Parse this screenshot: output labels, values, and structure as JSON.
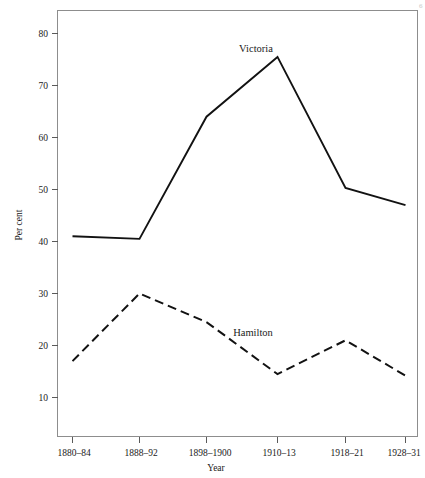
{
  "chart_data": {
    "type": "line",
    "title": "",
    "xlabel": "Year",
    "ylabel": "Per cent",
    "categories": [
      "1880–84",
      "1888–92",
      "1898–1900",
      "1910–13",
      "1918–21",
      "1928–31"
    ],
    "ylim": [
      5,
      84
    ],
    "yticks": [
      10,
      20,
      30,
      40,
      50,
      60,
      70,
      80
    ],
    "ytick_labels": [
      "10",
      "20",
      "30",
      "40",
      "50",
      "60",
      "70",
      "80"
    ],
    "grid": false,
    "legend_position": "inline-annotations",
    "series": [
      {
        "name": "Victoria",
        "style": "solid",
        "color": "#121212",
        "values": [
          41.0,
          40.5,
          64.0,
          75.5,
          50.3,
          47.0
        ]
      },
      {
        "name": "Hamilton",
        "style": "dashed",
        "color": "#121212",
        "values": [
          17.0,
          30.0,
          24.5,
          14.5,
          21.0,
          14.2
        ]
      }
    ],
    "annotations": [
      {
        "text": "Victoria",
        "x_px": 256,
        "y_px": 52
      },
      {
        "text": "Hamilton",
        "x_px": 253,
        "y_px": 336
      }
    ]
  },
  "axis": {
    "y_title": "Per cent",
    "x_title": "Year"
  },
  "page": {
    "corner_mark": "6"
  }
}
